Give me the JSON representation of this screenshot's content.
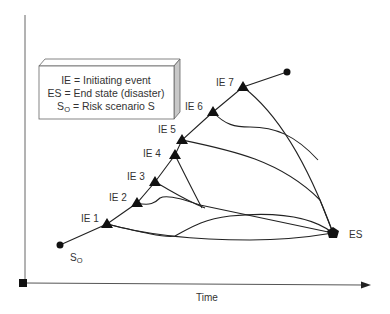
{
  "legend": {
    "line1": "IE = Initiating event",
    "line2": "ES = End state (disaster)",
    "line3_prefix": "S",
    "line3_sub": "O",
    "line3_rest": " = Risk scenario S"
  },
  "axis": {
    "x_label": "Time"
  },
  "nodes": {
    "start_label_main": "S",
    "start_label_sub": "O",
    "end_label": "ES",
    "events": [
      {
        "label": "IE 1"
      },
      {
        "label": "IE 2"
      },
      {
        "label": "IE 3"
      },
      {
        "label": "IE 4"
      },
      {
        "label": "IE 5"
      },
      {
        "label": "IE 6"
      },
      {
        "label": "IE 7"
      }
    ]
  },
  "colors": {
    "line": "#222222",
    "text": "#333333",
    "box_side": "#c8c8c8"
  }
}
